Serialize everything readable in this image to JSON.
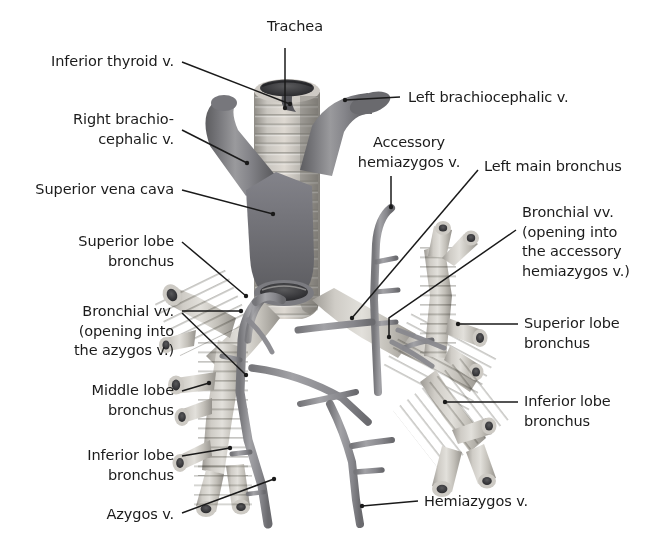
{
  "figure": {
    "background_color": "#ffffff",
    "text_color": "#1b1b1b",
    "leader_color": "#1a1a1a",
    "width": 668,
    "height": 552
  },
  "palette": {
    "vein_dark": "#6e6e70",
    "vein_mid": "#8b8b8d",
    "vein_light": "#b4b4b6",
    "cartilage_light": "#d8d6d2",
    "cartilage_mid": "#b9b6b0",
    "cartilage_shadow": "#8e8b85",
    "lumen_dark": "#4a4a4c",
    "lumen_black": "#2b2b2d"
  },
  "labels": [
    {
      "id": "trachea",
      "name": "trachea",
      "lines": [
        "Trachea"
      ],
      "align": "center",
      "x": 247,
      "y": 17,
      "w": 96
    },
    {
      "id": "inferior-thyroid-vein",
      "name": "inferior-thyroid-vein",
      "lines": [
        "Inferior thyroid v."
      ],
      "align": "right",
      "x": 14,
      "y": 52,
      "w": 160
    },
    {
      "id": "left-brachiocephalic-vein",
      "name": "left-brachiocephalic-vein",
      "lines": [
        "Left brachiocephalic v."
      ],
      "align": "left",
      "x": 408,
      "y": 88,
      "w": 200
    },
    {
      "id": "right-brachiocephalic-vein",
      "name": "right-brachiocephalic-vein",
      "lines": [
        "Right brachio-",
        "cephalic v."
      ],
      "align": "right",
      "x": 36,
      "y": 110,
      "w": 138
    },
    {
      "id": "accessory-hemiazygos-vein",
      "name": "accessory-hemiazygos-vein",
      "lines": [
        "Accessory",
        "hemiazygos v."
      ],
      "align": "center",
      "x": 344,
      "y": 133,
      "w": 130
    },
    {
      "id": "left-main-bronchus",
      "name": "left-main-bronchus",
      "lines": [
        "Left main bronchus"
      ],
      "align": "left",
      "x": 484,
      "y": 157,
      "w": 170
    },
    {
      "id": "superior-vena-cava",
      "name": "superior-vena-cava",
      "lines": [
        "Superior vena cava"
      ],
      "align": "right",
      "x": 14,
      "y": 180,
      "w": 160
    },
    {
      "id": "bronchial-vv-accessory",
      "name": "bronchial-veins-accessory-hemiazygos",
      "lines": [
        "Bronchial vv.",
        "(opening into",
        "the accessory",
        "hemiazygos v.)"
      ],
      "align": "left",
      "x": 522,
      "y": 203,
      "w": 142
    },
    {
      "id": "superior-lobe-bronchus-right",
      "name": "superior-lobe-bronchus-right",
      "lines": [
        "Superior lobe",
        "bronchus"
      ],
      "align": "right",
      "x": 22,
      "y": 232,
      "w": 152
    },
    {
      "id": "bronchial-vv-azygos",
      "name": "bronchial-veins-azygos",
      "lines": [
        "Bronchial vv.",
        "(opening into",
        "the azygos v.)"
      ],
      "align": "right",
      "x": 22,
      "y": 302,
      "w": 152
    },
    {
      "id": "superior-lobe-bronchus-left",
      "name": "superior-lobe-bronchus-left",
      "lines": [
        "Superior lobe",
        "bronchus"
      ],
      "align": "left",
      "x": 524,
      "y": 314,
      "w": 140
    },
    {
      "id": "middle-lobe-bronchus",
      "name": "middle-lobe-bronchus",
      "lines": [
        "Middle lobe",
        "bronchus"
      ],
      "align": "right",
      "x": 22,
      "y": 381,
      "w": 152
    },
    {
      "id": "inferior-lobe-bronchus-left",
      "name": "inferior-lobe-bronchus-left",
      "lines": [
        "Inferior lobe",
        "bronchus"
      ],
      "align": "left",
      "x": 524,
      "y": 392,
      "w": 140
    },
    {
      "id": "inferior-lobe-bronchus-right",
      "name": "inferior-lobe-bronchus-right",
      "lines": [
        "Inferior lobe",
        "bronchus"
      ],
      "align": "right",
      "x": 22,
      "y": 446,
      "w": 152
    },
    {
      "id": "hemiazygos-vein",
      "name": "hemiazygos-vein",
      "lines": [
        "Hemiazygos v."
      ],
      "align": "left",
      "x": 424,
      "y": 492,
      "w": 140
    },
    {
      "id": "azygos-vein",
      "name": "azygos-vein",
      "lines": [
        "Azygos v."
      ],
      "align": "right",
      "x": 52,
      "y": 505,
      "w": 122
    }
  ],
  "leaders": [
    {
      "name": "leader-trachea",
      "points": "285,48 285,108"
    },
    {
      "name": "leader-inferior-thyroid-vein",
      "points": "182,62 290,104"
    },
    {
      "name": "leader-left-brachiocephalic-vein",
      "points": "400,97 345,100"
    },
    {
      "name": "leader-right-brachiocephalic-vein",
      "points": "182,130 247,163"
    },
    {
      "name": "leader-accessory-hemiazygos-vein",
      "points": "391,176 391,207"
    },
    {
      "name": "leader-left-main-bronchus",
      "points": "478,170 352,318"
    },
    {
      "name": "leader-superior-vena-cava",
      "points": "182,190 273,214"
    },
    {
      "name": "leader-bronchial-vv-accessory",
      "points": "516,230 389,318 389,337"
    },
    {
      "name": "leader-superior-lobe-bronchus-right",
      "points": "182,242 246,296"
    },
    {
      "name": "leader-bronchial-vv-azygos",
      "points": "182,311 241,311"
    },
    {
      "name": "leader-bronchial-vv-azygos-2",
      "points": "182,313 246,375"
    },
    {
      "name": "leader-superior-lobe-bronchus-left",
      "points": "518,324 458,324"
    },
    {
      "name": "leader-middle-lobe-bronchus",
      "points": "182,391 209,383"
    },
    {
      "name": "leader-inferior-lobe-bronchus-left",
      "points": "518,402 445,402"
    },
    {
      "name": "leader-inferior-lobe-bronchus-right",
      "points": "182,456 230,448"
    },
    {
      "name": "leader-hemiazygos-vein",
      "points": "418,501 362,506"
    },
    {
      "name": "leader-azygos-vein",
      "points": "182,513 274,479"
    }
  ]
}
